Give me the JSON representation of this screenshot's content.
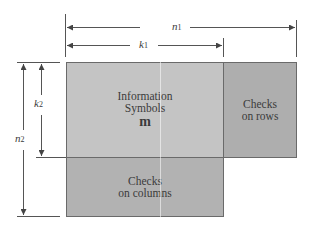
{
  "diagram": {
    "dimensions": {
      "n1": {
        "base": "n",
        "sub": "1"
      },
      "k1": {
        "base": "k",
        "sub": "1"
      },
      "n2": {
        "base": "n",
        "sub": "2"
      },
      "k2": {
        "base": "k",
        "sub": "2"
      }
    },
    "blocks": {
      "info": {
        "line1": "Information",
        "line2": "Symbols",
        "symbol": "m"
      },
      "rows": {
        "line1": "Checks",
        "line2": "on rows"
      },
      "cols": {
        "line1": "Checks",
        "line2": "on columns"
      }
    }
  }
}
